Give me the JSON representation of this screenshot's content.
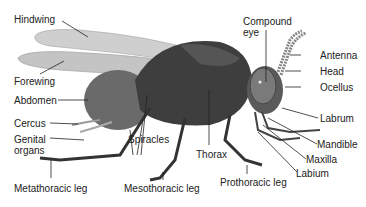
{
  "diagram": {
    "colors": {
      "body": "#4a4a4a",
      "body_dark": "#2e2e2e",
      "wing": "#c8c8c8",
      "eye": "#6a6a6a",
      "leader_line": "#222222",
      "text": "#222222"
    },
    "labels": {
      "hindwing": "Hindwing",
      "forewing": "Forewing",
      "abdomen": "Abdomen",
      "cercus": "Cercus",
      "genital_organs_1": "Genital",
      "genital_organs_2": "organs",
      "spiracles": "Spiracles",
      "metathoracic_leg": "Metathoracic leg",
      "mesothoracic_leg": "Mesothoracic leg",
      "thorax": "Thorax",
      "prothoracic_leg": "Prothoracic leg",
      "compound_eye_1": "Compound",
      "compound_eye_2": "eye",
      "antenna": "Antenna",
      "head": "Head",
      "ocellus": "Ocellus",
      "labrum": "Labrum",
      "mandible": "Mandible",
      "maxilla": "Maxilla",
      "labium": "Labium"
    }
  }
}
